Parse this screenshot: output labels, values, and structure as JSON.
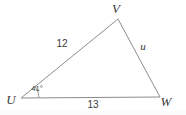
{
  "figure": {
    "kind": "triangle-diagram",
    "background_color": "#ffffff",
    "stroke_color": "#8c8c8c",
    "text_color": "#3a3a3a",
    "stroke_width": 1,
    "width": 186,
    "height": 115,
    "vertices": [
      {
        "name": "U",
        "label": "U",
        "x": 21,
        "y": 98,
        "label_x": 11,
        "label_y": 104
      },
      {
        "name": "V",
        "label": "V",
        "x": 118,
        "y": 19,
        "label_x": 116,
        "label_y": 13
      },
      {
        "name": "W",
        "label": "W",
        "x": 160,
        "y": 97,
        "label_x": 166,
        "label_y": 106
      }
    ],
    "sides": [
      {
        "name": "UV",
        "label": "12",
        "from": "U",
        "to": "V",
        "label_x": 62,
        "label_y": 47
      },
      {
        "name": "UW",
        "label": "13",
        "from": "U",
        "to": "W",
        "label_x": 93,
        "label_y": 108
      },
      {
        "name": "VW",
        "label": "u",
        "from": "V",
        "to": "W",
        "label_x": 143,
        "label_y": 50
      }
    ],
    "angles": [
      {
        "name": "angle-at-U",
        "at": "U",
        "label": "41°",
        "label_x": 37,
        "label_y": 91,
        "arc_radius": 18
      }
    ]
  }
}
